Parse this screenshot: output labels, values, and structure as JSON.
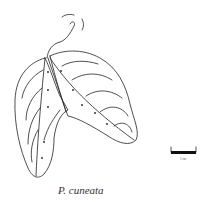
{
  "figure": {
    "caption": "P. cuneata",
    "scale_bar": {
      "label": "1 cm"
    }
  }
}
